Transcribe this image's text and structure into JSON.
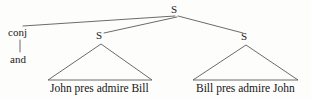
{
  "figure": {
    "kind": "syntax-tree",
    "background_color": "#fdfdfb",
    "line_color": "#5a5a5a",
    "text_color": "#1c1c1c"
  },
  "nodes": {
    "root": {
      "label": "S",
      "x": 176,
      "y": 10
    },
    "conj_category": {
      "label": "conj",
      "x": 21,
      "y": 33
    },
    "conj_word": {
      "label": "and",
      "x": 19,
      "y": 60
    },
    "left_s": {
      "label": "S",
      "x": 100,
      "y": 36
    },
    "right_s": {
      "label": "S",
      "x": 245,
      "y": 37
    }
  },
  "terminals": {
    "left_clause": "John pres admire Bill",
    "right_clause": "Bill pres admire John"
  },
  "edges": [
    {
      "name": "root-to-conj",
      "x1": 175,
      "y1": 16,
      "x2": 23,
      "y2": 26
    },
    {
      "name": "root-to-left-s",
      "x1": 177,
      "y1": 17,
      "x2": 104,
      "y2": 33
    },
    {
      "name": "root-to-right-s",
      "x1": 178,
      "y1": 16,
      "x2": 243,
      "y2": 33
    },
    {
      "name": "conj-to-and",
      "x1": 20,
      "y1": 40,
      "x2": 20,
      "y2": 52
    }
  ],
  "triangles": [
    {
      "name": "left-triangle",
      "apex_x": 101,
      "apex_y": 44,
      "left_x": 48,
      "right_x": 152,
      "base_y": 80
    },
    {
      "name": "right-triangle",
      "apex_x": 246,
      "apex_y": 45,
      "left_x": 193,
      "right_x": 298,
      "base_y": 80
    }
  ]
}
